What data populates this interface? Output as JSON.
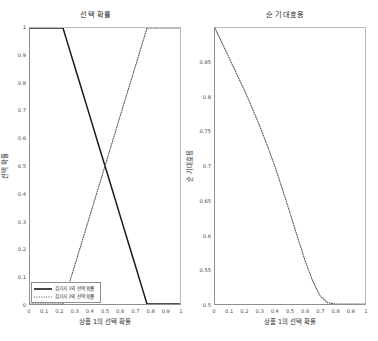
{
  "figure": {
    "background": "#ffffff",
    "width": 378,
    "height": 341
  },
  "panels": {
    "left": {
      "title": "선택 확률",
      "xlabel": "상품 1의 선택 확률",
      "ylabel": "선택 확률",
      "xticks": [
        "0",
        "0.1",
        "0.2",
        "0.3",
        "0.4",
        "0.5",
        "0.6",
        "0.7",
        "0.8",
        "0.9",
        "1"
      ],
      "yticks": [
        "0",
        "0.1",
        "0.2",
        "0.3",
        "0.4",
        "0.5",
        "0.6",
        "0.7",
        "0.8",
        "0.9",
        "1"
      ],
      "legend": [
        {
          "label": "참가자 1의 선택 확률",
          "style": "solid",
          "color": "#1a1a1a"
        },
        {
          "label": "참가자 2의 선택 확률",
          "style": "dotted",
          "color": "#555555"
        }
      ]
    },
    "right": {
      "title": "순 기대효용",
      "xlabel": "상품 1의 선택 확률",
      "ylabel": "순 기대효용",
      "xticks": [
        "0",
        "0.1",
        "0.2",
        "0.3",
        "0.4",
        "0.5",
        "0.6",
        "0.7",
        "0.8",
        "0.9",
        "1"
      ],
      "yticks": [
        "0.5",
        "0.55",
        "0.6",
        "0.65",
        "0.7",
        "0.75",
        "0.8",
        "0.85"
      ]
    }
  },
  "chart_data": [
    {
      "type": "line",
      "title": "선택 확률",
      "xlabel": "상품 1의 선택 확률",
      "ylabel": "선택 확률",
      "xlim": [
        0,
        1
      ],
      "ylim": [
        0,
        1
      ],
      "grid": false,
      "legend_position": "lower left",
      "series": [
        {
          "name": "참가자 1의 선택 확률",
          "style": "solid",
          "color": "#1a1a1a",
          "x": [
            0,
            0.05,
            0.1,
            0.15,
            0.2,
            0.22,
            0.25,
            0.3,
            0.35,
            0.4,
            0.45,
            0.5,
            0.55,
            0.6,
            0.65,
            0.7,
            0.75,
            0.78,
            0.8,
            0.85,
            0.9,
            0.95,
            1
          ],
          "y": [
            1,
            1,
            1,
            1,
            1,
            1,
            0.946,
            0.857,
            0.768,
            0.679,
            0.589,
            0.5,
            0.411,
            0.321,
            0.232,
            0.143,
            0.054,
            0,
            0,
            0,
            0,
            0,
            0
          ]
        },
        {
          "name": "참가자 2의 선택 확률",
          "style": "dotted",
          "color": "#555555",
          "x": [
            0,
            0.05,
            0.1,
            0.15,
            0.2,
            0.22,
            0.25,
            0.3,
            0.35,
            0.4,
            0.45,
            0.5,
            0.55,
            0.6,
            0.65,
            0.7,
            0.75,
            0.78,
            0.8,
            0.85,
            0.9,
            0.95,
            1
          ],
          "y": [
            0,
            0,
            0,
            0,
            0,
            0,
            0.054,
            0.143,
            0.232,
            0.321,
            0.411,
            0.5,
            0.589,
            0.679,
            0.768,
            0.857,
            0.946,
            1,
            1,
            1,
            1,
            1,
            1
          ]
        }
      ]
    },
    {
      "type": "line",
      "title": "순 기대효용",
      "xlabel": "상품 1의 선택 확률",
      "ylabel": "순 기대효용",
      "xlim": [
        0,
        1
      ],
      "ylim": [
        0.5,
        0.9
      ],
      "grid": false,
      "legend_position": "none",
      "series": [
        {
          "name": "순 기대효용",
          "style": "dotted",
          "color": "#555555",
          "x": [
            0,
            0.05,
            0.1,
            0.15,
            0.2,
            0.25,
            0.3,
            0.35,
            0.4,
            0.45,
            0.5,
            0.55,
            0.6,
            0.65,
            0.7,
            0.75,
            0.8,
            0.85,
            0.9,
            0.95,
            1
          ],
          "y": [
            0.9,
            0.877,
            0.854,
            0.831,
            0.808,
            0.783,
            0.757,
            0.729,
            0.699,
            0.666,
            0.632,
            0.597,
            0.563,
            0.534,
            0.512,
            0.502,
            0.5,
            0.5,
            0.5,
            0.5,
            0.5
          ]
        }
      ]
    }
  ]
}
